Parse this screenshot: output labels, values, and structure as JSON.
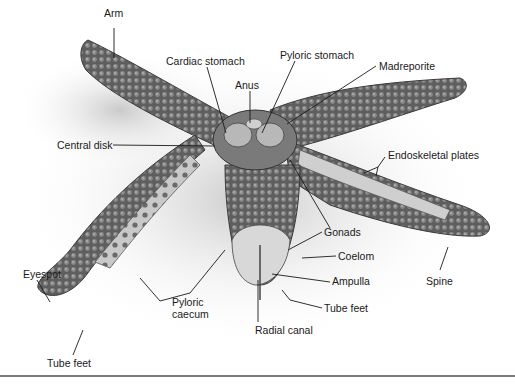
{
  "diagram": {
    "labels": [
      {
        "id": "arm",
        "text": "Arm",
        "x": 90,
        "y": 19
      },
      {
        "id": "cardiac-stomach",
        "text": "Cardiac stomach",
        "x": 166,
        "y": 56
      },
      {
        "id": "pyloric-stomach",
        "text": "Pyloric stomach",
        "x": 280,
        "y": 49
      },
      {
        "id": "anus",
        "text": "Anus",
        "x": 235,
        "y": 80
      },
      {
        "id": "madreporite",
        "text": "Madreporite",
        "x": 379,
        "y": 60
      },
      {
        "id": "central-disk",
        "text": "Central disk",
        "x": 57,
        "y": 139
      },
      {
        "id": "endoskeletal-plates",
        "text": "Endoskeletal plates",
        "x": 388,
        "y": 149
      },
      {
        "id": "gonads",
        "text": "Gonads",
        "x": 324,
        "y": 226
      },
      {
        "id": "coelom",
        "text": "Coelom",
        "x": 338,
        "y": 251
      },
      {
        "id": "ampulla",
        "text": "Ampulla",
        "x": 332,
        "y": 275
      },
      {
        "id": "spine",
        "text": "Spine",
        "x": 426,
        "y": 275
      },
      {
        "id": "eyespot",
        "text": "Eyespot",
        "x": 23,
        "y": 268
      },
      {
        "id": "pyloric-caecum",
        "text": "Pyloric caecum",
        "x": 172,
        "y": 296
      },
      {
        "id": "tube-feet-center",
        "text": "Tube feet",
        "x": 324,
        "y": 302
      },
      {
        "id": "radial-canal",
        "text": "Radial canal",
        "x": 255,
        "y": 324
      },
      {
        "id": "tube-feet-left",
        "text": "Tube feet",
        "x": 47,
        "y": 357
      }
    ]
  }
}
